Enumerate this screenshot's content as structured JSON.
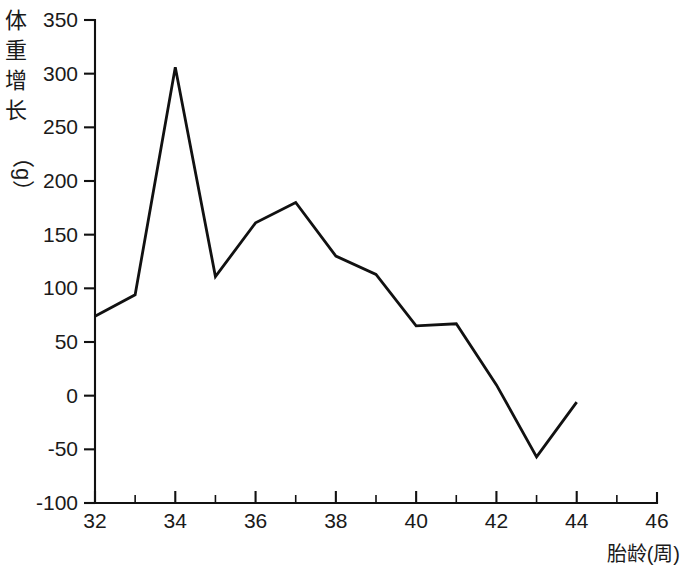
{
  "chart_data": {
    "type": "line",
    "title": "",
    "xlabel": "胎龄(周)",
    "ylabel": "体重增长（g）",
    "ylabel_chars": [
      "体",
      "重",
      "增",
      "长"
    ],
    "ylabel_unit": "（g）",
    "x": [
      32,
      33,
      34,
      35,
      36,
      37,
      38,
      39,
      40,
      41,
      42,
      43,
      44
    ],
    "values": [
      74,
      94,
      306,
      111,
      161,
      180,
      130,
      113,
      65,
      67,
      10,
      -57,
      -6
    ],
    "series": [
      {
        "name": "体重增长",
        "values": [
          74,
          94,
          306,
          111,
          161,
          180,
          130,
          113,
          65,
          67,
          10,
          -57,
          -6
        ]
      }
    ],
    "xlim": [
      32,
      46
    ],
    "ylim": [
      -100,
      350
    ],
    "x_tick_step": 2,
    "x_minor_tick_step": 1,
    "y_tick_step": 50,
    "xticks": [
      "32",
      "34",
      "36",
      "38",
      "40",
      "42",
      "44",
      "46"
    ],
    "xtick_values": [
      32,
      34,
      36,
      38,
      40,
      42,
      44,
      46
    ],
    "yticks": [
      "-100",
      "-50",
      "0",
      "50",
      "100",
      "150",
      "200",
      "250",
      "300",
      "350"
    ],
    "ytick_values": [
      -100,
      -50,
      0,
      50,
      100,
      150,
      200,
      250,
      300,
      350
    ],
    "grid": false,
    "legend": false,
    "legend_position": "none",
    "line_color": "#111111",
    "background_color": "#ffffff"
  }
}
